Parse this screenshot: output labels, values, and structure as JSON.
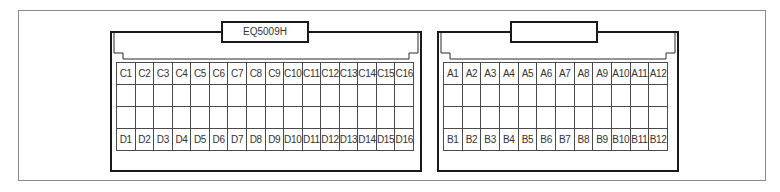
{
  "diagram": {
    "type": "connector-pinout",
    "connectors": [
      {
        "id": "left",
        "label": "EQ5009H",
        "columns": 16,
        "rows": [
          [
            "C1",
            "C2",
            "C3",
            "C4",
            "C5",
            "C6",
            "C7",
            "C8",
            "C9",
            "C10",
            "C11",
            "C12",
            "C13",
            "C14",
            "C15",
            "C16"
          ],
          [
            "",
            "",
            "",
            "",
            "",
            "",
            "",
            "",
            "",
            "",
            "",
            "",
            "",
            "",
            "",
            ""
          ],
          [
            "",
            "",
            "",
            "",
            "",
            "",
            "",
            "",
            "",
            "",
            "",
            "",
            "",
            "",
            "",
            ""
          ],
          [
            "D1",
            "D2",
            "D3",
            "D4",
            "D5",
            "D6",
            "D7",
            "D8",
            "D9",
            "D10",
            "D11",
            "D12",
            "D13",
            "D14",
            "D15",
            "D16"
          ]
        ]
      },
      {
        "id": "right",
        "label": "",
        "columns": 12,
        "rows": [
          [
            "A1",
            "A2",
            "A3",
            "A4",
            "A5",
            "A6",
            "A7",
            "A8",
            "A9",
            "A10",
            "A11",
            "A12"
          ],
          [
            "",
            "",
            "",
            "",
            "",
            "",
            "",
            "",
            "",
            "",
            "",
            ""
          ],
          [
            "",
            "",
            "",
            "",
            "",
            "",
            "",
            "",
            "",
            "",
            "",
            ""
          ],
          [
            "B1",
            "B2",
            "B3",
            "B4",
            "B5",
            "B6",
            "B7",
            "B8",
            "B9",
            "B10",
            "B11",
            "B12"
          ]
        ]
      }
    ]
  },
  "colors": {
    "frame_border": "#8a8a8a",
    "connector_border": "#1a1a1a",
    "grid_line": "#4a4a4a",
    "text": "#333333"
  }
}
